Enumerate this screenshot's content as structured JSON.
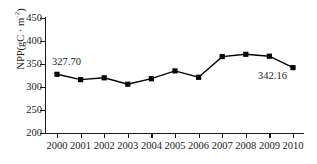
{
  "chart_data": {
    "type": "line",
    "title": "",
    "subtitle": "",
    "xlabel": "",
    "ylabel": "NPP(gC · m-2)",
    "ylabel_base": "NPP(gC · m",
    "ylabel_exp": "-2",
    "ylabel_close": ")",
    "categories": [
      "2000",
      "2001",
      "2002",
      "2003",
      "2004",
      "2005",
      "2006",
      "2007",
      "2008",
      "2009",
      "2010"
    ],
    "x": [
      2000,
      2001,
      2002,
      2003,
      2004,
      2005,
      2006,
      2007,
      2008,
      2009,
      2010
    ],
    "values": [
      327.7,
      316.0,
      320.0,
      306.0,
      318.0,
      335.0,
      321.0,
      366.0,
      371.0,
      367.0,
      342.16
    ],
    "series": [
      {
        "name": "NPP",
        "values": [
          327.7,
          316.0,
          320.0,
          306.0,
          318.0,
          335.0,
          321.0,
          366.0,
          371.0,
          367.0,
          342.16
        ]
      }
    ],
    "ylim": [
      200,
      450
    ],
    "xlim": [
      2000,
      2010
    ],
    "yticks": [
      200,
      250,
      300,
      350,
      400,
      450
    ],
    "ytick_labels": [
      "200",
      "250",
      "300",
      "350",
      "400",
      "450"
    ],
    "xticks": [
      2000,
      2001,
      2002,
      2003,
      2004,
      2005,
      2006,
      2007,
      2008,
      2009,
      2010
    ],
    "grid": false,
    "legend": "none",
    "line_color": "#000000",
    "marker_color": "#000000",
    "marker": "square",
    "annotations": [
      {
        "label": "327.70",
        "x": 2000,
        "y": 327.7,
        "position": "above-right"
      },
      {
        "label": "342.16",
        "x": 2010,
        "y": 342.16,
        "position": "below-left"
      }
    ]
  },
  "annotation_labels": {
    "first": "327.70",
    "last": "342.16"
  }
}
